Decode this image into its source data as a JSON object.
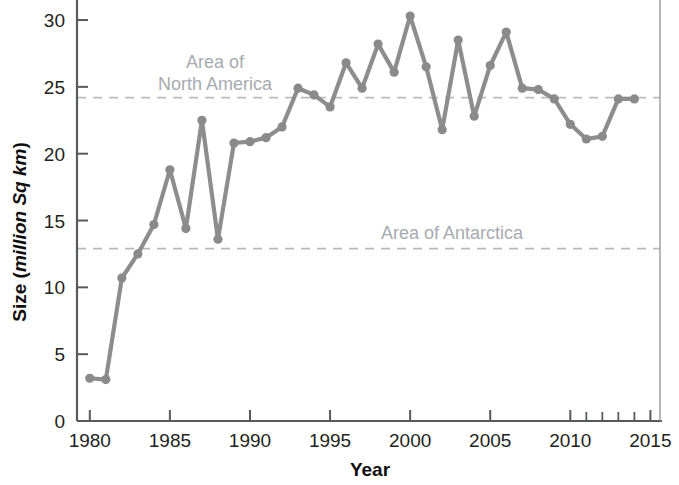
{
  "chart_data": {
    "type": "line",
    "title": "",
    "xlabel": "Year",
    "ylabel": "Size (million Sq km)",
    "ylabel_parts": {
      "plain": "Size (",
      "italic": "million Sq km",
      "tail": ")"
    },
    "xlim": [
      1979.2,
      2015.6
    ],
    "ylim": [
      0,
      31.2
    ],
    "xticks": [
      1980,
      1985,
      1990,
      1995,
      2000,
      2005,
      2010,
      2015
    ],
    "xtick_labels": [
      "1980",
      "1985",
      "1990",
      "1995",
      "2000",
      "2005",
      "2010",
      "2015"
    ],
    "xticks_minor": [
      2011,
      2012,
      2013,
      2014
    ],
    "yticks": [
      0,
      5,
      10,
      15,
      20,
      25,
      30
    ],
    "ytick_labels": [
      "0",
      "5",
      "10",
      "15",
      "20",
      "25",
      "30"
    ],
    "grid": false,
    "legend": "none",
    "line_color": "#8d8d8d",
    "marker_color": "#8a8a8a",
    "x": [
      1980,
      1981,
      1982,
      1983,
      1984,
      1985,
      1986,
      1987,
      1988,
      1989,
      1990,
      1991,
      1992,
      1993,
      1994,
      1995,
      1996,
      1997,
      1998,
      1999,
      2000,
      2001,
      2002,
      2003,
      2004,
      2005,
      2006,
      2007,
      2008,
      2009,
      2010,
      2011,
      2012,
      2013,
      2014
    ],
    "values": [
      3.2,
      3.1,
      10.7,
      12.5,
      14.7,
      18.8,
      14.4,
      22.5,
      13.6,
      20.8,
      20.9,
      21.2,
      22.0,
      24.9,
      24.4,
      23.5,
      26.8,
      24.9,
      28.2,
      26.1,
      30.3,
      26.5,
      21.8,
      28.5,
      22.8,
      26.6,
      29.1,
      24.9,
      24.8,
      24.1,
      22.2,
      21.1,
      21.3,
      24.1,
      24.1
    ],
    "reference_lines": [
      {
        "id": "north-america",
        "label": "Area of\nNorth America",
        "label_line1": "Area of",
        "label_line2": "North America",
        "value": 24.2,
        "color": "#b9bcc0"
      },
      {
        "id": "antarctica",
        "label": "Area of Antarctica",
        "label_line1": "Area of Antarctica",
        "label_line2": "",
        "value": 12.9,
        "color": "#b9bcc0"
      }
    ]
  }
}
